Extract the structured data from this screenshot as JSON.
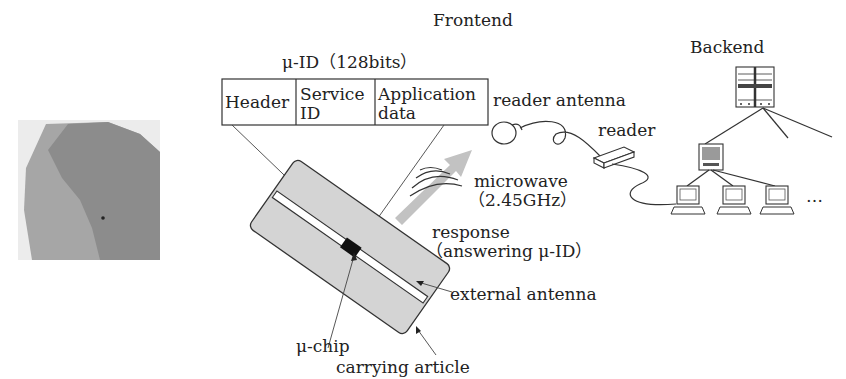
{
  "diagram": {
    "frontend_label": "Frontend",
    "backend_label": "Backend",
    "uid_title": "μ-ID（128bits）",
    "uid_fields": {
      "header": "Header",
      "service_line1": "Service",
      "service_line2": "ID",
      "application_line1": "Application",
      "application_line2": "data"
    },
    "reader_antenna_label": "reader antenna",
    "reader_label": "reader",
    "microwave_line1": "microwave",
    "microwave_line2": "（2.45GHz）",
    "response_line1": "response",
    "response_line2": "（answering μ-ID）",
    "external_antenna_label": "external antenna",
    "chip_label": "μ-chip",
    "article_label": "carrying article",
    "ellipsis": "…"
  },
  "colors": {
    "article_fill": "#d4d4d4",
    "arrow_fill": "#c0c0c0",
    "photo_dark": "#8a8a8a",
    "photo_light": "#a8a8a8"
  }
}
